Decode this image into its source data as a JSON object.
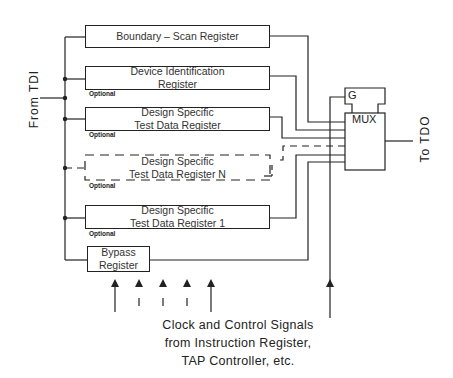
{
  "diagram": {
    "input_label": "From TDI",
    "output_label": "To TDO",
    "registers": [
      {
        "id": "boundary",
        "line1": "Boundary – Scan Register",
        "line2": "",
        "optional": false,
        "dashed": false
      },
      {
        "id": "device_id",
        "line1": "Device Identification",
        "line2": "Register",
        "optional": true,
        "dashed": false
      },
      {
        "id": "ds_tdr",
        "line1": "Design Specific",
        "line2": "Test Data Register",
        "optional": true,
        "dashed": false
      },
      {
        "id": "ds_tdr_n",
        "line1": "Design Specific",
        "line2": "Test Data Register N",
        "optional": true,
        "dashed": true
      },
      {
        "id": "ds_tdr_1",
        "line1": "Design Specific",
        "line2": "Test Data Register 1",
        "optional": true,
        "dashed": false
      },
      {
        "id": "bypass",
        "line1": "Bypass",
        "line2": "Register",
        "optional": false,
        "dashed": false
      }
    ],
    "optional_label": "Optional",
    "mux": {
      "label": "MUX",
      "gate_label": "G"
    },
    "control_caption": [
      "Clock and Control Signals",
      "from Instruction Register,",
      "TAP Controller, etc."
    ],
    "colors": {
      "line": "#222222",
      "background": "#ffffff"
    }
  }
}
